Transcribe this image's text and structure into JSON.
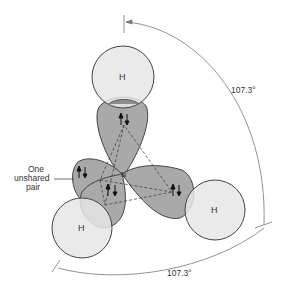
{
  "diagram": {
    "atoms": [
      {
        "id": "H-top",
        "label": "H"
      },
      {
        "id": "H-right",
        "label": "H"
      },
      {
        "id": "H-left",
        "label": "H"
      },
      {
        "id": "N-center",
        "label": "N"
      }
    ],
    "annotations": {
      "lone_pair_line1": "One",
      "lone_pair_line2": "unshared",
      "lone_pair_line3": "pair",
      "angle_right": "107.3°",
      "angle_bottom": "107.3°"
    },
    "colors": {
      "hydrogen_fill": "#e6e6e6",
      "orbital_fill": "#a9a9a9",
      "overlap_fill": "#8f8f8f",
      "stroke": "#444444"
    }
  }
}
